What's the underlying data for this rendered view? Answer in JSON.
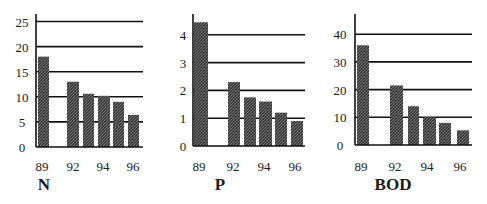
{
  "figure": {
    "panels": [
      "N",
      "P",
      "BOD"
    ]
  },
  "chart_data": [
    {
      "type": "bar",
      "title": "N",
      "xlabel": "N",
      "ylabel": "",
      "categories": [
        "89",
        "92",
        "93",
        "94",
        "95",
        "96"
      ],
      "x_tick_labels": [
        "89",
        "92",
        "94",
        "96"
      ],
      "values": [
        18,
        13,
        10.6,
        10.2,
        9,
        6.4
      ],
      "y_ticks": [
        0,
        5,
        10,
        15,
        20,
        25
      ],
      "ylim": [
        0,
        27
      ],
      "grid": true,
      "layout": {
        "axis_x": 36,
        "baseline": 147,
        "top": 14,
        "px_per_unit": 5.02,
        "grid_end": 143,
        "bars": [
          [
            38,
            49
          ],
          [
            67,
            79
          ],
          [
            83,
            94
          ],
          [
            98,
            110
          ],
          [
            113,
            124
          ],
          [
            128,
            139
          ]
        ],
        "xlabel_x": [
          42,
          73,
          103,
          133
        ],
        "tick_x": 22,
        "title_x": 44
      }
    },
    {
      "type": "bar",
      "title": "P",
      "xlabel": "P",
      "ylabel": "",
      "categories": [
        "89",
        "92",
        "93",
        "94",
        "95",
        "96"
      ],
      "x_tick_labels": [
        "89",
        "92",
        "94",
        "96"
      ],
      "values": [
        4.45,
        2.3,
        1.75,
        1.6,
        1.2,
        0.9
      ],
      "y_ticks": [
        0,
        1,
        2,
        3,
        4
      ],
      "ylim": [
        0,
        4.8
      ],
      "grid": true,
      "layout": {
        "axis_x": 193,
        "baseline": 146,
        "top": 14,
        "px_per_unit": 27.8,
        "grid_end": 305,
        "bars": [
          [
            194,
            208
          ],
          [
            228,
            240
          ],
          [
            244,
            256
          ],
          [
            259,
            272
          ],
          [
            275,
            287
          ],
          [
            291,
            303
          ]
        ],
        "xlabel_x": [
          199,
          233,
          264,
          295
        ],
        "tick_x": 183,
        "title_x": 220
      }
    },
    {
      "type": "bar",
      "title": "BOD",
      "xlabel": "BOD",
      "ylabel": "",
      "categories": [
        "89",
        "92",
        "93",
        "94",
        "95",
        "96"
      ],
      "x_tick_labels": [
        "89",
        "92",
        "94",
        "96"
      ],
      "values": [
        36,
        21.5,
        14,
        10,
        8,
        5.3
      ],
      "y_ticks": [
        0,
        10,
        20,
        30,
        40
      ],
      "ylim": [
        0,
        47
      ],
      "grid": true,
      "layout": {
        "axis_x": 355,
        "baseline": 145,
        "top": 14,
        "px_per_unit": 2.77,
        "grid_end": 472,
        "bars": [
          [
            357,
            369
          ],
          [
            390,
            403
          ],
          [
            408,
            419
          ],
          [
            423,
            436
          ],
          [
            439,
            451
          ],
          [
            457,
            469
          ]
        ],
        "xlabel_x": [
          361,
          395,
          427,
          460
        ],
        "tick_x": 340,
        "title_x": 393
      }
    }
  ],
  "colors": {
    "bar": "#3a3a3a",
    "bar_hatch": "#8a8a8a",
    "axis": "#111111",
    "background": "#ffffff"
  }
}
